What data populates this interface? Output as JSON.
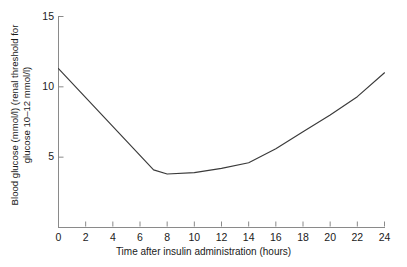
{
  "chart_data": {
    "type": "line",
    "title": "",
    "xlabel": "Time after insulin administration (hours)",
    "ylabel_line1": "Blood glucose (mmol/l) (renal threshold for",
    "ylabel_line2": "glucose 10–12 mmol/l)",
    "xlim": [
      0,
      24
    ],
    "ylim": [
      0,
      15
    ],
    "xticks": [
      0,
      2,
      4,
      6,
      8,
      10,
      12,
      14,
      16,
      18,
      20,
      22,
      24
    ],
    "yticks": [
      5,
      10,
      15
    ],
    "xtick_labels": [
      "0",
      "2",
      "4",
      "6",
      "8",
      "10",
      "12",
      "14",
      "16",
      "18",
      "20",
      "22",
      "24"
    ],
    "ytick_labels": [
      "5",
      "10",
      "15"
    ],
    "grid": false,
    "legend": false,
    "line_color": "#3a3a3a",
    "axis_color": "#8a8a8a",
    "series": [
      {
        "name": "Blood glucose",
        "x": [
          0,
          7,
          8,
          10,
          12,
          14,
          16,
          18,
          20,
          22,
          24
        ],
        "values": [
          11.3,
          4.1,
          3.8,
          3.9,
          4.2,
          4.6,
          5.6,
          6.8,
          8.0,
          9.3,
          11.0
        ]
      }
    ]
  }
}
